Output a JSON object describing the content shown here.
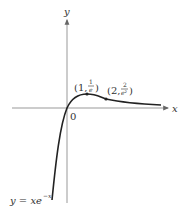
{
  "diagram": {
    "function_label": "y = xe",
    "function_exponent": "−x",
    "axes": {
      "x_label": "x",
      "y_label": "y",
      "origin_label": "0"
    },
    "points": [
      {
        "label_open": "(1, ",
        "num": "1",
        "den": "e",
        "label_close": ")"
      },
      {
        "label_open": "(2, ",
        "num": "2",
        "den": "e²",
        "label_close": ")"
      }
    ],
    "colors": {
      "axis": "#888888",
      "curve": "#222222",
      "text": "#333333"
    }
  }
}
